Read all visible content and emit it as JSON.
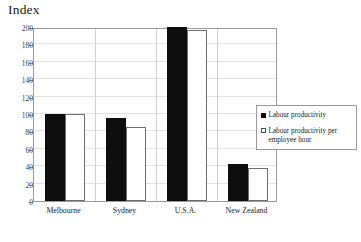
{
  "chart_data": {
    "type": "bar",
    "title": "Index",
    "xlabel": "",
    "ylabel": "",
    "ylim": [
      0,
      200
    ],
    "ytick_step": 20,
    "yticks": [
      0,
      20,
      40,
      60,
      80,
      100,
      120,
      140,
      160,
      180,
      200
    ],
    "grid": true,
    "legend_position": "right",
    "categories": [
      "Melbourne",
      "Sydney",
      "U.S.A.",
      "New Zealand"
    ],
    "series": [
      {
        "name": "Labour productivity",
        "color": "#0d0d0d",
        "marker": "filled-square",
        "values": [
          100,
          95,
          200,
          42
        ]
      },
      {
        "name": "Labour productivity per employee hour",
        "color": "#ffffff",
        "marker": "open-square",
        "values": [
          100,
          85,
          196,
          38
        ]
      }
    ]
  },
  "legend": {
    "entries": [
      {
        "label": "Labour productivity"
      },
      {
        "label": "Labour productivity per employee hour"
      }
    ]
  }
}
